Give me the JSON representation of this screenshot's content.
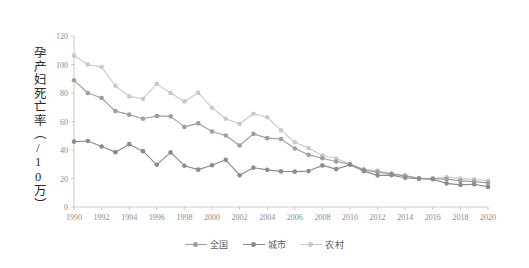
{
  "chart_data": {
    "type": "line",
    "title": "",
    "xlabel": "",
    "ylabel": "孕产妇死亡率（/10万）",
    "xlim": [
      1990,
      2020
    ],
    "ylim": [
      0,
      120
    ],
    "yticks": [
      0,
      20,
      40,
      60,
      80,
      100,
      120
    ],
    "xticks": [
      1990,
      1992,
      1994,
      1996,
      1998,
      2000,
      2002,
      2004,
      2006,
      2008,
      2010,
      2012,
      2014,
      2016,
      2018,
      2020
    ],
    "grid": false,
    "legend_position": "bottom-center",
    "x": [
      1990,
      1991,
      1992,
      1993,
      1994,
      1995,
      1996,
      1997,
      1998,
      1999,
      2000,
      2001,
      2002,
      2003,
      2004,
      2005,
      2006,
      2007,
      2008,
      2009,
      2010,
      2011,
      2012,
      2013,
      2014,
      2015,
      2016,
      2017,
      2018,
      2019,
      2020
    ],
    "series": [
      {
        "name": "全国",
        "color": "#9e9e9e",
        "values": [
          88.9,
          80.0,
          76.5,
          67.3,
          64.8,
          61.9,
          63.9,
          63.6,
          56.2,
          58.7,
          53.0,
          50.2,
          43.2,
          51.3,
          48.3,
          47.7,
          41.1,
          36.6,
          34.2,
          31.9,
          30.0,
          26.1,
          24.5,
          23.2,
          21.7,
          20.1,
          19.9,
          19.6,
          18.3,
          17.8,
          16.9
        ]
      },
      {
        "name": "城市",
        "color": "#8c8c8c",
        "values": [
          45.9,
          46.3,
          42.5,
          38.5,
          44.1,
          39.2,
          29.6,
          38.3,
          29.0,
          26.2,
          29.3,
          33.1,
          22.3,
          27.6,
          26.1,
          25.0,
          24.8,
          25.2,
          29.2,
          26.6,
          29.7,
          25.2,
          22.2,
          22.4,
          20.5,
          19.8,
          19.5,
          16.6,
          15.5,
          16.0,
          14.1
        ]
      },
      {
        "name": "农村",
        "color": "#c9c9c9",
        "values": [
          106.2,
          100.0,
          98.2,
          85.1,
          77.6,
          76.0,
          86.4,
          80.0,
          74.1,
          80.2,
          69.6,
          61.9,
          58.2,
          65.4,
          63.0,
          53.8,
          45.5,
          41.3,
          36.1,
          34.0,
          30.1,
          26.5,
          25.6,
          23.6,
          22.2,
          20.2,
          20.0,
          21.1,
          19.9,
          19.4,
          18.4
        ]
      }
    ]
  },
  "axis": {
    "y_title": "孕产妇死亡率（/10万）",
    "y_tick_labels": [
      "0",
      "20",
      "40",
      "60",
      "80",
      "100",
      "120"
    ],
    "x_tick_labels": [
      "1990",
      "1992",
      "1994",
      "1996",
      "1998",
      "2000",
      "2002",
      "2004",
      "2006",
      "2008",
      "2010",
      "2012",
      "2014",
      "2016",
      "2018",
      "2020"
    ]
  },
  "legend": {
    "items": [
      {
        "label": "全国",
        "color": "#9e9e9e"
      },
      {
        "label": "城市",
        "color": "#8c8c8c"
      },
      {
        "label": "农村",
        "color": "#c9c9c9"
      }
    ]
  },
  "colors": {
    "axis": "#bdbdbd",
    "tick_text": "#8a8a8a",
    "background": "#ffffff",
    "title_text": "#2b2b2b"
  }
}
